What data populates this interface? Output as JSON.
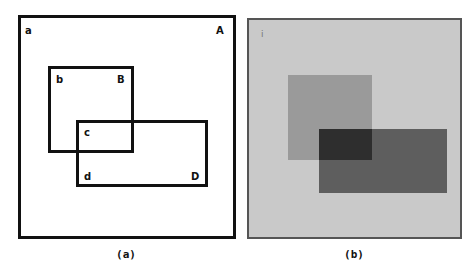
{
  "figure": {
    "panel_a": {
      "caption": "(a)",
      "regions": [
        {
          "id": "A",
          "corner_label": "a",
          "label": "A",
          "box": {
            "x": 18,
            "y": 15,
            "w": 218,
            "h": 224
          }
        },
        {
          "id": "B",
          "corner_label": "b",
          "label": "B",
          "box": {
            "x": 48,
            "y": 66,
            "w": 86,
            "h": 87
          }
        },
        {
          "id": "D",
          "corner_label": "d",
          "label": "D",
          "box": {
            "x": 76,
            "y": 120,
            "w": 132,
            "h": 67
          }
        }
      ],
      "overlap_label": "c"
    },
    "panel_b": {
      "caption": "(b)",
      "corner_mark": "i",
      "background_color": "#c9c9c9",
      "border_color": "#555555",
      "regions": [
        {
          "id": "B",
          "color": "#9a9a9a"
        },
        {
          "id": "D",
          "color": "#5e5e5e"
        },
        {
          "id": "overlap",
          "color": "#2e2e2e"
        }
      ]
    }
  }
}
